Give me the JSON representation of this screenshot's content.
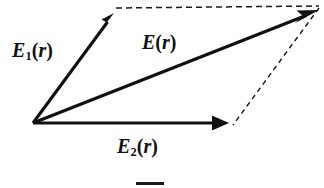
{
  "figure": {
    "background_color": "#ffffff",
    "stroke_color": "#111111",
    "width": 324,
    "height": 188,
    "origin": {
      "x": 33,
      "y": 123
    },
    "labels": {
      "e1": {
        "symbol": "E",
        "subscript": "1",
        "argument": "r",
        "open": "(",
        "close": ")",
        "text": "E1(r)"
      },
      "e": {
        "symbol": "E",
        "subscript": "",
        "argument": "r",
        "open": "(",
        "close": ")",
        "text": "E(r)"
      },
      "e2": {
        "symbol": "E",
        "subscript": "2",
        "argument": "r",
        "open": "(",
        "close": ")",
        "text": "E2(r)"
      }
    },
    "caption_fragment": "",
    "vectors": [
      {
        "name": "E1(r)",
        "style": "solid",
        "from": {
          "x": 33,
          "y": 123
        },
        "to": {
          "x": 114,
          "y": 13
        },
        "arrowhead": true
      },
      {
        "name": "E(r)",
        "style": "solid",
        "from": {
          "x": 33,
          "y": 123
        },
        "to": {
          "x": 319,
          "y": 10
        },
        "arrowhead": true
      },
      {
        "name": "E2(r)",
        "style": "solid",
        "from": {
          "x": 33,
          "y": 123
        },
        "to": {
          "x": 229,
          "y": 123
        },
        "arrowhead": true
      }
    ],
    "construction_lines": [
      {
        "name": "top-dashed-edge",
        "style": "dashed",
        "from": {
          "x": 116,
          "y": 8
        },
        "to": {
          "x": 319,
          "y": 6
        }
      },
      {
        "name": "right-dashed-edge",
        "style": "dashed",
        "from": {
          "x": 319,
          "y": 8
        },
        "to": {
          "x": 233,
          "y": 125
        }
      }
    ]
  }
}
